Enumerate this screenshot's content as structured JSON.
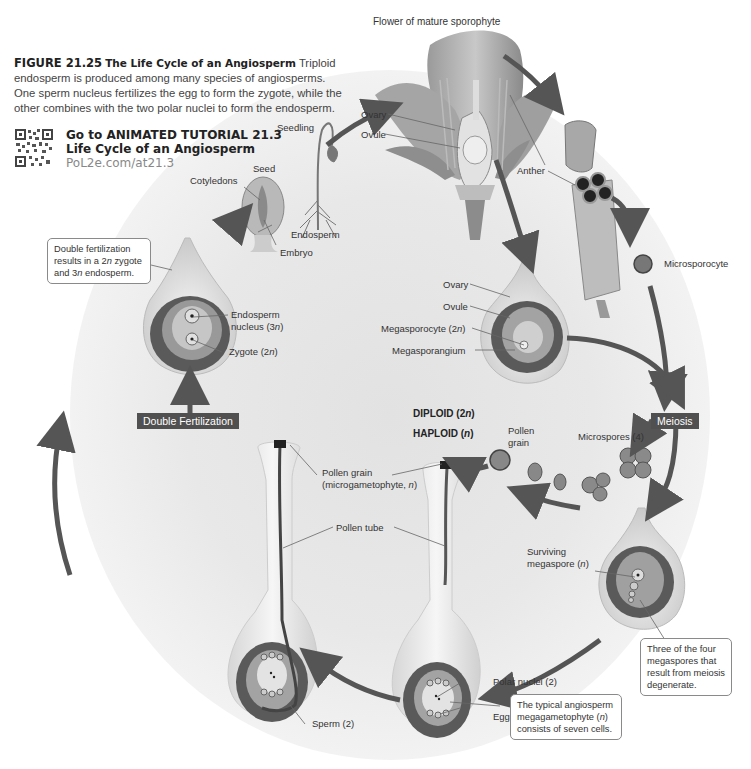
{
  "figure": {
    "number": "FIGURE 21.25",
    "title": "The Life Cycle of an Angiosperm",
    "caption": "Triploid endosperm is produced among many species of angiosperms. One sperm nucleus fertilizes the egg to form the zygote, while the other combines with the two polar nuclei to form the endosperm."
  },
  "tutorial": {
    "line1": "Go to ANIMATED TUTORIAL 21.3",
    "line2": "Life Cycle of an Angiosperm",
    "link": "PoL2e.com/at21.3",
    "icon": "qr-code-icon"
  },
  "labels": {
    "flower_title": "Flower of mature sporophyte",
    "flower_ovary": "Ovary",
    "flower_ovule": "Ovule",
    "anther": "Anther",
    "microsporocyte": "Microsporocyte",
    "seedling": "Seedling",
    "seed": "Seed",
    "cotyledons": "Cotyledons",
    "endosperm": "Endosperm",
    "embryo": "Embryo",
    "ovary2": "Ovary",
    "ovule2": "Ovule",
    "megasporocyte": "Megasporocyte (2n)",
    "megasporangium": "Megasporangium",
    "endosperm_nucleus_1": "Endosperm",
    "endosperm_nucleus_2": "nucleus (3n)",
    "zygote": "Zygote (2n)",
    "microspores": "Microspores (4)",
    "pollen_grain_1": "Pollen",
    "pollen_grain_2": "grain",
    "pollen_grain_micro_1": "Pollen grain",
    "pollen_grain_micro_2": "(microgametophyte, n)",
    "pollen_tube": "Pollen tube",
    "surviving_megaspore_1": "Surviving",
    "surviving_megaspore_2": "megaspore (n)",
    "polar_nuclei": "Polar nuclei (2)",
    "egg": "Egg",
    "sperm": "Sperm (2)"
  },
  "legend": {
    "diploid": "DIPLOID (2n)",
    "haploid": "HAPLOID (n)"
  },
  "stages": {
    "meiosis": "Meiosis",
    "double_fertilization": "Double Fertilization"
  },
  "callouts": {
    "double_fertilization": "Double fertilization results in a 2n zygote and 3n endosperm.",
    "megaspores": "Three of the four megaspores that result from meiosis degenerate.",
    "megagametophyte": "The typical angiosperm megagametophyte (n) consists of seven cells."
  },
  "colors": {
    "arrow": "#555555",
    "stage_box": "#505050",
    "diploid_tissue": "#8f8f8f",
    "haploid_tissue": "#6a6a6a",
    "background_circle": "#e6e6e6"
  }
}
